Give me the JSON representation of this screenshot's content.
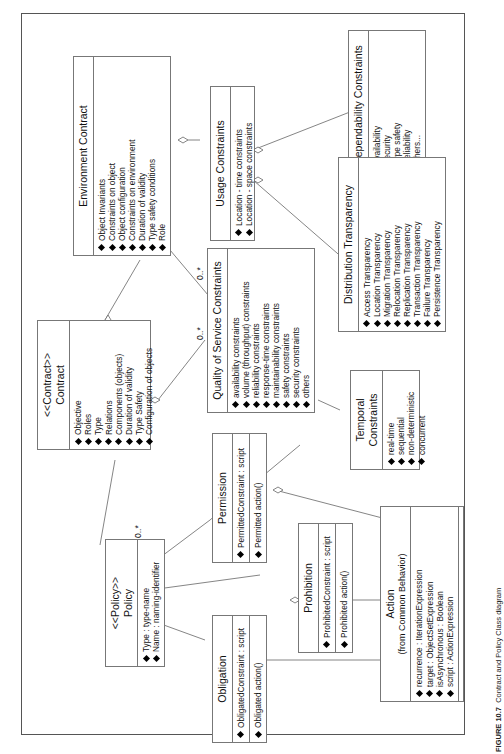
{
  "caption": {
    "label": "FIGURE 10.7",
    "text": "Contract and Policy Class diagram"
  },
  "classes": {
    "dependability": {
      "name": "Dependability Constraints",
      "attrs": [
        "Availability",
        "Security",
        "Type safety",
        "Reliability",
        "others..."
      ]
    },
    "usage": {
      "name": "Usage Constraints",
      "attrs": [
        "Location - time constraints",
        "Location - space constraints"
      ]
    },
    "environment": {
      "name": "Environment Contract",
      "attrs": [
        "Object Invariants",
        "Constraints on object",
        "Object configuration",
        "Constraints on environment",
        "Duration of validity",
        "Type safety conditions",
        "Role"
      ]
    },
    "distribution": {
      "name": "Distribution Transparency",
      "attrs": [
        "Access Transparency",
        "Location Transparency",
        "Migration Transparency",
        "Relocation Transparency",
        "Replication Transparency",
        "Transaction Transparency",
        "Failure Transparency",
        "Persistence Transparency"
      ]
    },
    "qos": {
      "name": "Quality of Service Constraints",
      "attrs": [
        "availability constraints",
        "volume (throughput) constraints",
        "reliability constraints",
        "response-time constraints",
        "maintainability constraints",
        "safety constraints",
        "security constraints",
        "others"
      ]
    },
    "temporal": {
      "name": "Temporal Constraints",
      "attrs": [
        "real-time",
        "sequential",
        "non-deterministic",
        "concurrent"
      ]
    },
    "contract": {
      "stereotype": "<<Contract>>",
      "name": "Contract",
      "attrs": [
        "Objective",
        "Roles",
        "Type",
        "Relations",
        "Components (objects)",
        "Duration of validity",
        "Type Safety",
        "Configuration of objects"
      ]
    },
    "policy": {
      "stereotype": "<<Policy>>",
      "name": "Policy",
      "attrs": [
        "Type : type-name",
        "Name : naming-identifier"
      ]
    },
    "permission": {
      "name": "Permission",
      "attrs": [
        "PermittedConstraint : script"
      ],
      "ops": [
        "Permitted action()"
      ]
    },
    "prohibition": {
      "name": "Prohibition",
      "attrs": [
        "ProhibitedConstraint : script"
      ],
      "ops": [
        "Prohibited action()"
      ]
    },
    "obligation": {
      "name": "Obligation",
      "attrs": [
        "ObligatedConstraint : script"
      ],
      "ops": [
        "Obligated action()"
      ]
    },
    "action": {
      "name": "Action",
      "subtitle": "(from Common Behavior)",
      "attrs": [
        "recurrence : IterationExpression",
        "target : ObjectSetExpression",
        "isAsynchronous : Boolean",
        "script : ActionExpression"
      ]
    }
  },
  "multiplicities": {
    "env_qos": "0..*",
    "contract_qos": "0..*",
    "policy_contract": "0..*"
  }
}
